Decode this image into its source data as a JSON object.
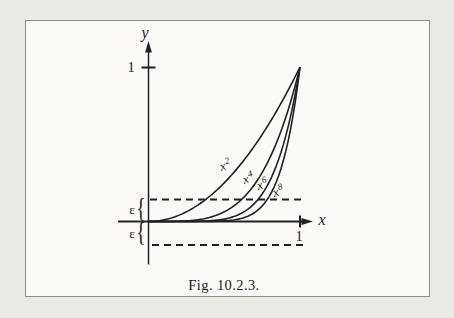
{
  "figure": {
    "caption": "Fig. 10.2.3."
  },
  "axes": {
    "x_label": "x",
    "y_label": "y",
    "x_tick_label": "1",
    "y_tick_label": "1",
    "epsilon_label": "ε",
    "brace_glyph": "{"
  },
  "colors": {
    "ink": "#212121",
    "paper_outer": "#ebe9e4",
    "paper_inner": "#fbfaf7",
    "frame_border": "#8d8d8d"
  },
  "chart_data": {
    "type": "line",
    "title": "Fig. 10.2.3.",
    "xlabel": "x",
    "ylabel": "y",
    "xlim": [
      0,
      1
    ],
    "ylim": [
      -0.2,
      1.1
    ],
    "grid": false,
    "legend_position": "labels-on-curves",
    "x_ticks": [
      {
        "value": 1,
        "label": "1"
      }
    ],
    "y_ticks": [
      {
        "value": 1,
        "label": "1"
      }
    ],
    "series": [
      {
        "name": "x^2",
        "base": "x",
        "exponent": "2",
        "formula": "y = x^2",
        "x_range": [
          0,
          1
        ]
      },
      {
        "name": "x^4",
        "base": "x",
        "exponent": "4",
        "formula": "y = x^4",
        "x_range": [
          0,
          1
        ]
      },
      {
        "name": "x^6",
        "base": "x",
        "exponent": "6",
        "formula": "y = x^6",
        "x_range": [
          0,
          1
        ]
      },
      {
        "name": "x^8",
        "base": "x",
        "exponent": "8",
        "formula": "y = x^8",
        "x_range": [
          0,
          1
        ]
      }
    ],
    "sampled_values": {
      "x": [
        0,
        0.25,
        0.5,
        0.75,
        1
      ],
      "x^2": [
        0,
        0.0625,
        0.25,
        0.5625,
        1
      ],
      "x^4": [
        0,
        0.0039,
        0.0625,
        0.3164,
        1
      ],
      "x^6": [
        0,
        0.0002,
        0.0156,
        0.178,
        1
      ],
      "x^8": [
        0,
        1.53e-05,
        0.0039,
        0.1001,
        1
      ]
    },
    "annotations": [
      {
        "kind": "dashed-line",
        "y": "ε",
        "approx_value": 0.14,
        "x_span": [
          0,
          1
        ]
      },
      {
        "kind": "dashed-line",
        "y": "−ε",
        "approx_value": -0.15,
        "x_span": [
          0,
          1
        ]
      },
      {
        "kind": "brace",
        "label": "ε",
        "span": "0 to ε on y-axis"
      },
      {
        "kind": "brace",
        "label": "ε",
        "span": "0 to −ε on y-axis"
      },
      {
        "kind": "convergence-point",
        "x": 1,
        "y": 1
      }
    ]
  }
}
